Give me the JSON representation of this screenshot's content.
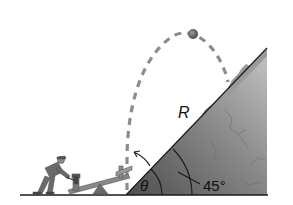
{
  "diagram": {
    "type": "physics-projectile-on-incline",
    "labels": {
      "range": "R",
      "launch_angle": "θ",
      "incline_angle": "45°"
    },
    "colors": {
      "background": "#ffffff",
      "hill_dark": "#5a5a5a",
      "hill_light": "#b8b8b8",
      "trajectory": "#8c8c8c",
      "ball": "#6e6e6e",
      "line": "#1a1a1a",
      "figure": "#6a6a6a"
    },
    "elements": [
      "person-with-hammer",
      "seesaw-launcher",
      "dashed-trajectory",
      "ball",
      "inclined-hill",
      "ground-line",
      "angle-arcs"
    ]
  }
}
